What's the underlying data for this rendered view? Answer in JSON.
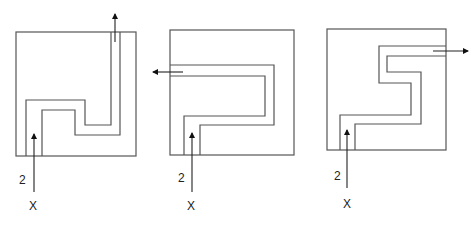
{
  "diagram": {
    "figures": [
      {
        "id": "figure-1",
        "entry_label": "2",
        "entry_point_label": "X",
        "exit_direction": "up"
      },
      {
        "id": "figure-2",
        "entry_label": "2",
        "entry_point_label": "X",
        "exit_direction": "left"
      },
      {
        "id": "figure-3",
        "entry_label": "2",
        "entry_point_label": "X",
        "exit_direction": "right"
      }
    ],
    "colors": {
      "wall": "#555555",
      "arrow": "#111111",
      "background": "#ffffff"
    }
  }
}
